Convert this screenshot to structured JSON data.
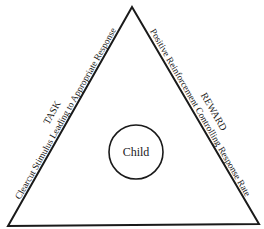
{
  "diagram": {
    "center_label": "Child",
    "left_side": {
      "title": "TASK",
      "subtitle": "Clearcut Stimulus Leading to Appropriate Response"
    },
    "right_side": {
      "title": "REWARD",
      "subtitle": "Positive Reinforcement Controlling Response Rate"
    },
    "colors": {
      "stroke": "#1a1a1a",
      "background": "#ffffff"
    }
  }
}
